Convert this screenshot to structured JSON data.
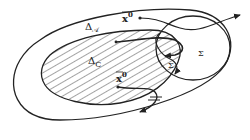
{
  "diagram": {
    "labels": {
      "outer_region": "Δ",
      "outer_region_sub": "𝒜",
      "inner_region": "Δ",
      "inner_region_sub": "C",
      "start_point_top": "x",
      "start_point_top_sup": "0",
      "start_point_bottom": "x",
      "start_point_bottom_sup": "0",
      "target_set_outer": "Σ",
      "target_set_inner": "Σ"
    },
    "colors": {
      "ink": "#222222",
      "background": "#ffffff"
    }
  }
}
